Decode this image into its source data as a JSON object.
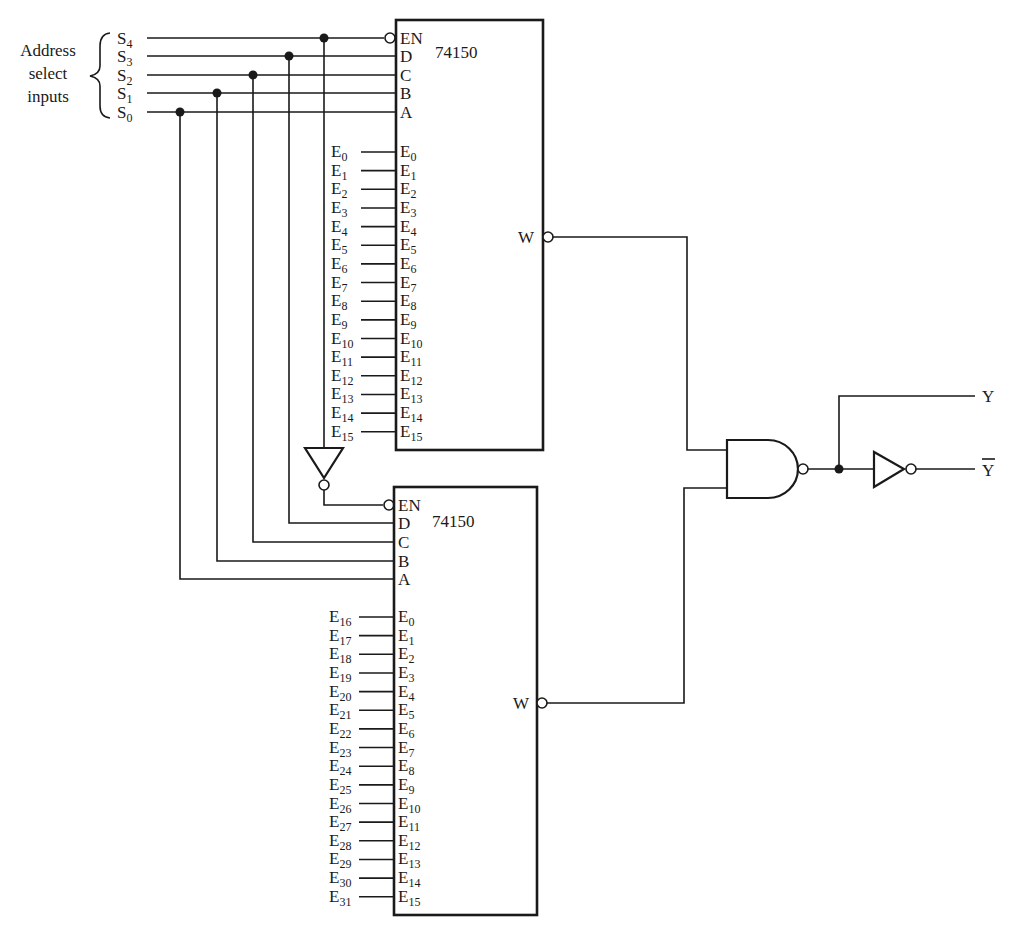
{
  "address_group_label": [
    "Address",
    "select",
    "inputs"
  ],
  "select_inputs": [
    {
      "base": "S",
      "sub": "4",
      "pin": "EN"
    },
    {
      "base": "S",
      "sub": "3",
      "pin": "D"
    },
    {
      "base": "S",
      "sub": "2",
      "pin": "C"
    },
    {
      "base": "S",
      "sub": "1",
      "pin": "B"
    },
    {
      "base": "S",
      "sub": "0",
      "pin": "A"
    }
  ],
  "chips": [
    {
      "part": "74150",
      "control_pins": [
        "EN",
        "D",
        "C",
        "B",
        "A"
      ],
      "output_pin": "W",
      "inputs_external": [
        "0",
        "1",
        "2",
        "3",
        "4",
        "5",
        "6",
        "7",
        "8",
        "9",
        "10",
        "11",
        "12",
        "13",
        "14",
        "15"
      ],
      "inputs_internal": [
        "0",
        "1",
        "2",
        "3",
        "4",
        "5",
        "6",
        "7",
        "8",
        "9",
        "10",
        "11",
        "12",
        "13",
        "14",
        "15"
      ]
    },
    {
      "part": "74150",
      "control_pins": [
        "EN",
        "D",
        "C",
        "B",
        "A"
      ],
      "output_pin": "W",
      "inputs_external": [
        "16",
        "17",
        "18",
        "19",
        "20",
        "21",
        "22",
        "23",
        "24",
        "25",
        "26",
        "27",
        "28",
        "29",
        "30",
        "31"
      ],
      "inputs_internal": [
        "0",
        "1",
        "2",
        "3",
        "4",
        "5",
        "6",
        "7",
        "8",
        "9",
        "10",
        "11",
        "12",
        "13",
        "14",
        "15"
      ]
    }
  ],
  "input_base": "E",
  "outputs": {
    "y": "Y",
    "y_bar": "Y"
  },
  "gates": [
    "inverter-en",
    "nand",
    "output-inverter"
  ]
}
